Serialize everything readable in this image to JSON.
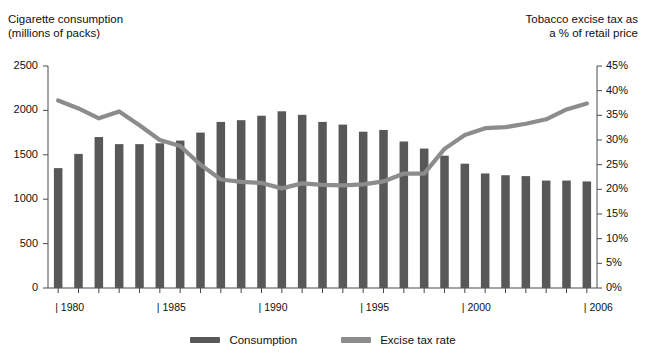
{
  "axis_titles": {
    "left": "Cigarette consumption\n(millions of packs)",
    "right": "Tobacco excise tax as\na % of retail price"
  },
  "legend": {
    "consumption": {
      "label": "Consumption",
      "color": "#585858",
      "swatch_name": "legend-swatch-consumption"
    },
    "excise": {
      "label": "Excise tax rate",
      "color": "#8c8c8c",
      "swatch_name": "legend-swatch-excise-tax-rate"
    }
  },
  "chart_data": {
    "type": "bar",
    "title": "",
    "subtitle": "",
    "xlabel": "",
    "ylabel": "Cigarette consumption (millions of packs)",
    "y2label": "Tobacco excise tax as a % of retail price",
    "grid": false,
    "legend_position": "bottom",
    "categories": [
      "1980",
      "1981",
      "1982",
      "1983",
      "1984",
      "1985",
      "1986",
      "1987",
      "1988",
      "1989",
      "1990",
      "1991",
      "1992",
      "1993",
      "1994",
      "1995",
      "1996",
      "1997",
      "1998",
      "1999",
      "2000",
      "2001",
      "2002",
      "2003",
      "2004",
      "2005",
      "2006"
    ],
    "x_tick_labels": [
      "1980",
      "1985",
      "1990",
      "1995",
      "2000",
      "2006"
    ],
    "x_tick_categories": [
      "1980",
      "1985",
      "1990",
      "1995",
      "2000",
      "2006"
    ],
    "ylim": [
      0,
      2500
    ],
    "yticks": [
      0,
      500,
      1000,
      1500,
      2000,
      2500
    ],
    "ytick_labels": [
      "0",
      "500",
      "1000",
      "1500",
      "2000",
      "2500"
    ],
    "y2lim": [
      0,
      45
    ],
    "y2ticks": [
      0,
      5,
      10,
      15,
      20,
      25,
      30,
      35,
      40,
      45
    ],
    "y2tick_labels": [
      "0%",
      "5%",
      "10%",
      "15%",
      "20%",
      "25%",
      "30%",
      "35%",
      "40%",
      "45%"
    ],
    "series": [
      {
        "name": "Consumption",
        "type": "bar",
        "axis": "left",
        "units": "millions of packs",
        "color": "#585858",
        "values": [
          1350,
          1510,
          1700,
          1620,
          1620,
          1630,
          1660,
          1750,
          1870,
          1890,
          1940,
          1990,
          1950,
          1870,
          1840,
          1760,
          1780,
          1650,
          1570,
          1490,
          1400,
          1290,
          1270,
          1260,
          1210,
          1210,
          1200
        ]
      },
      {
        "name": "Excise tax rate",
        "type": "line",
        "axis": "right",
        "units": "% of retail price",
        "color": "#8c8c8c",
        "values": [
          38.0,
          36.4,
          34.4,
          35.8,
          33.0,
          30.0,
          28.8,
          25.0,
          22.0,
          21.5,
          21.3,
          20.2,
          21.2,
          20.9,
          20.8,
          21.0,
          21.6,
          23.2,
          23.2,
          28.2,
          31.0,
          32.4,
          32.6,
          33.3,
          34.2,
          36.2,
          37.4
        ]
      }
    ]
  }
}
